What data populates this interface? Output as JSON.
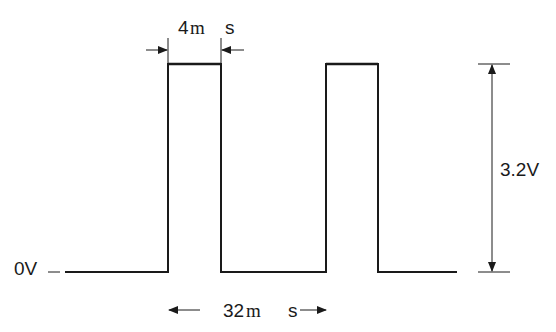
{
  "diagram": {
    "type": "square-wave-timing",
    "pulse_width_label": {
      "value": "4",
      "unit_prefix": "m",
      "unit": "s"
    },
    "period_label": {
      "value": "32",
      "unit_prefix": "m",
      "unit": "s"
    },
    "amplitude_label": "3.2V",
    "baseline_label": "0V",
    "baseline_dash": "_",
    "colors": {
      "line": "#1a1a1a",
      "background": "#ffffff"
    },
    "waveform": {
      "low_y": 272,
      "high_y": 64,
      "points": [
        [
          65,
          272
        ],
        [
          168,
          272
        ],
        [
          168,
          64
        ],
        [
          221,
          64
        ],
        [
          221,
          272
        ],
        [
          326,
          272
        ],
        [
          326,
          64
        ],
        [
          378,
          64
        ],
        [
          378,
          272
        ],
        [
          457,
          272
        ]
      ]
    }
  }
}
